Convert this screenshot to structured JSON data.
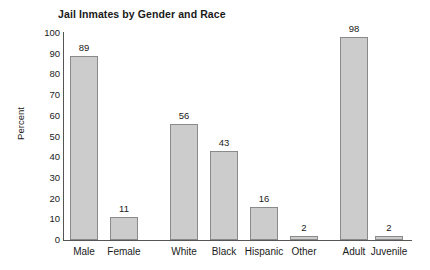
{
  "chart_data": {
    "type": "bar",
    "title": "Jail Inmates by Gender and Race",
    "xlabel": "",
    "ylabel": "Percent",
    "ylim": [
      0,
      100
    ],
    "ytick_step": 10,
    "yticks": [
      100,
      90,
      80,
      70,
      60,
      50,
      40,
      30,
      20,
      10,
      0
    ],
    "grid": false,
    "legend": false,
    "bar_fill_color": "#cccccc",
    "bar_border_color": "#8a8a8a",
    "axis_color": "#555555",
    "data_labels_shown": true,
    "categories": [
      "Male",
      "Female",
      "White",
      "Black",
      "Hispanic",
      "Other",
      "Adult",
      "Juvenile"
    ],
    "values": [
      89,
      11,
      56,
      43,
      16,
      2,
      98,
      2
    ],
    "groups": [
      {
        "name": "Gender",
        "categories": [
          "Male",
          "Female"
        ],
        "values": [
          89,
          11
        ]
      },
      {
        "name": "Race",
        "categories": [
          "White",
          "Black",
          "Hispanic",
          "Other"
        ],
        "values": [
          56,
          43,
          16,
          2
        ]
      },
      {
        "name": "Age",
        "categories": [
          "Adult",
          "Juvenile"
        ],
        "values": [
          98,
          2
        ]
      }
    ],
    "bars": [
      {
        "label": "Male",
        "value": 89,
        "x": 6,
        "width": 28
      },
      {
        "label": "Female",
        "value": 11,
        "x": 46,
        "width": 28
      },
      {
        "label": "White",
        "value": 56,
        "x": 106,
        "width": 28
      },
      {
        "label": "Black",
        "value": 43,
        "x": 146,
        "width": 28
      },
      {
        "label": "Hispanic",
        "value": 16,
        "x": 186,
        "width": 28
      },
      {
        "label": "Other",
        "value": 2,
        "x": 226,
        "width": 28
      },
      {
        "label": "Adult",
        "value": 98,
        "x": 276,
        "width": 28
      },
      {
        "label": "Juvenile",
        "value": 2,
        "x": 311,
        "width": 28
      }
    ]
  }
}
